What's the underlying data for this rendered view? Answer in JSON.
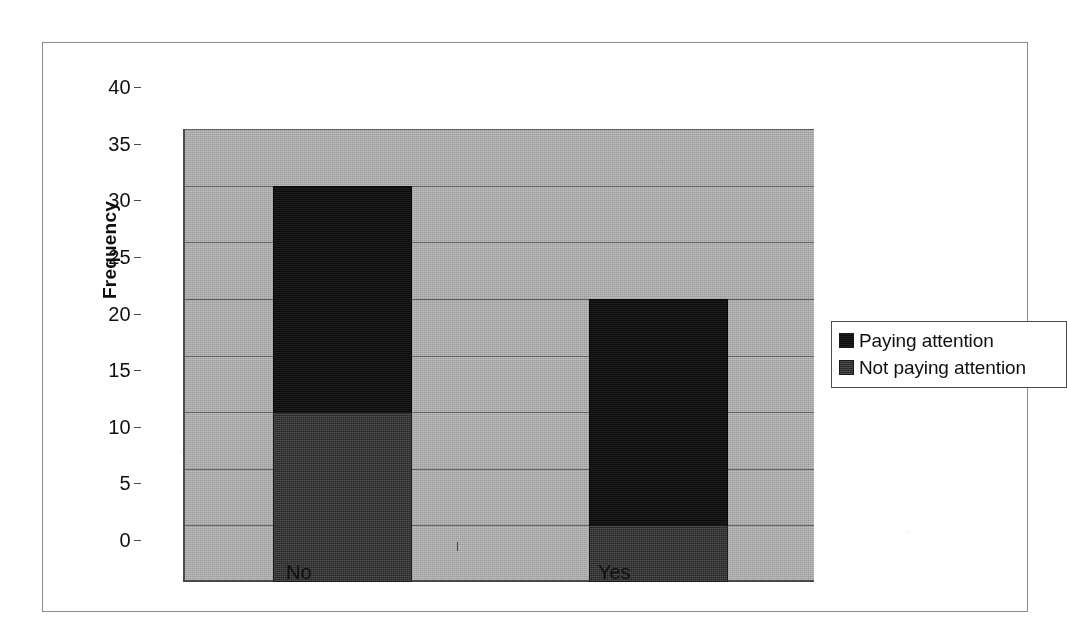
{
  "chart_data": {
    "type": "bar",
    "subtype": "stacked",
    "title": "",
    "xlabel": "",
    "ylabel": "Frequency",
    "categories": [
      "No",
      "Yes"
    ],
    "series": [
      {
        "name": "Not paying attention",
        "values": [
          15,
          5
        ],
        "color": "#3a3a3a"
      },
      {
        "name": "Paying attention",
        "values": [
          20,
          20
        ],
        "color": "#141414"
      }
    ],
    "stack_totals": [
      35,
      25
    ],
    "ylim": [
      0,
      40
    ],
    "ytick_step": 5,
    "yticks": [
      "0",
      "5",
      "10",
      "15",
      "20",
      "25",
      "30",
      "35",
      "40"
    ],
    "grid": true,
    "legend_position": "right",
    "plot_background": "#a9a9a9"
  },
  "legend": {
    "entries": [
      {
        "label": "Paying attention",
        "swatch": "dark"
      },
      {
        "label": "Not paying attention",
        "swatch": "mid"
      }
    ]
  },
  "axes": {
    "y_title": "Frequency",
    "x_labels": [
      "No",
      "Yes"
    ]
  }
}
